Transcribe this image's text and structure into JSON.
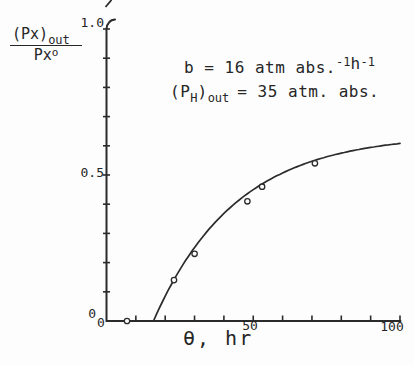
{
  "figure": {
    "background": "#fdfdfd",
    "ink_color": "#2b2b2b"
  },
  "y_axis_label": {
    "numerator_main": "(Px)",
    "numerator_sub": "out",
    "denominator_main": "Px",
    "denominator_sup": "o"
  },
  "annotation": {
    "line1": {
      "prefix": "b = 16 atm abs.",
      "sup1": "-1",
      "h": "h",
      "sup2": "-1"
    },
    "line2": {
      "p_open": "(P",
      "h_sub": "H",
      "paren_close": ")",
      "out_sub": "out",
      "value": "= 35 atm. abs."
    }
  },
  "chart_data": {
    "type": "scatter",
    "title": "",
    "xlabel": "θ, hr",
    "ylabel": "(Px)out / Pxo",
    "x_axis": {
      "label": "θ, hr",
      "range": [
        0,
        100
      ],
      "tick_step": 10,
      "labeled_ticks": [
        {
          "value": 0,
          "text": "0"
        },
        {
          "value": 50,
          "text": "50"
        },
        {
          "value": 100,
          "text": "100"
        }
      ]
    },
    "y_axis": {
      "label": "(Px)out / Pxo",
      "range": [
        0,
        1.0
      ],
      "tick_step": 0.1,
      "labeled_ticks": [
        {
          "value": 1.0,
          "text": "1.0"
        },
        {
          "value": 0.5,
          "text": "0.5"
        },
        {
          "value": 0,
          "text": "0"
        }
      ]
    },
    "points": [
      [
        7,
        0.0
      ],
      [
        23,
        0.14
      ],
      [
        30,
        0.23
      ],
      [
        48,
        0.41
      ],
      [
        53,
        0.46
      ],
      [
        71,
        0.54
      ]
    ],
    "fit_curve": {
      "model": "y = A*(1 - exp(-(theta - theta0)/tau)) for theta >= theta0",
      "A": 0.64,
      "theta0": 16,
      "tau": 28,
      "theta_end": 100,
      "end_value": 0.61
    },
    "annotations": [
      "b = 16 atm abs.⁻¹h⁻¹",
      "(P_H)_out = 35 atm. abs."
    ],
    "grid": false,
    "legend": "none"
  }
}
